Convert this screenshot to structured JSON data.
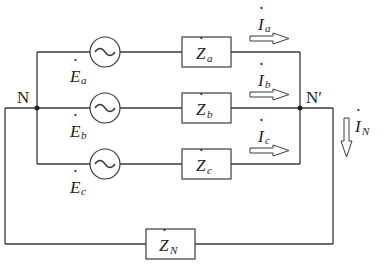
{
  "nodes": {
    "left": "N",
    "right": "N′"
  },
  "sources": [
    {
      "symbol": "E",
      "subscript": "a"
    },
    {
      "symbol": "E",
      "subscript": "b"
    },
    {
      "symbol": "E",
      "subscript": "c"
    }
  ],
  "impedances": [
    {
      "symbol": "Z",
      "subscript": "a"
    },
    {
      "symbol": "Z",
      "subscript": "b"
    },
    {
      "symbol": "Z",
      "subscript": "c"
    }
  ],
  "neutral_impedance": {
    "symbol": "Z",
    "subscript": "N"
  },
  "currents": [
    {
      "symbol": "I",
      "subscript": "a"
    },
    {
      "symbol": "I",
      "subscript": "b"
    },
    {
      "symbol": "I",
      "subscript": "c"
    }
  ],
  "neutral_current": {
    "symbol": "I",
    "subscript": "N"
  },
  "source_glyph": "∼",
  "phasor_dot": "·"
}
